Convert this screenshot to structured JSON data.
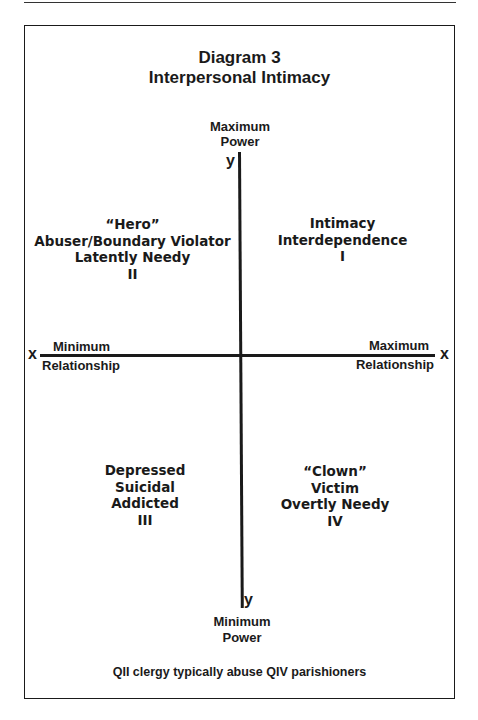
{
  "title": {
    "line1": "Diagram 3",
    "line2": "Interpersonal Intimacy"
  },
  "axes": {
    "y_top": {
      "letter": "y",
      "line1": "Maximum",
      "line2": "Power"
    },
    "y_bottom": {
      "letter": "y",
      "line1": "Minimum",
      "line2": "Power"
    },
    "x_left": {
      "letter": "x",
      "line1": "Minimum",
      "line2": "Relationship"
    },
    "x_right": {
      "letter": "x",
      "line1": "Maximum",
      "line2": "Relationship"
    }
  },
  "quadrants": {
    "q1": {
      "lines": [
        "Intimacy",
        "Interdependence",
        "I"
      ]
    },
    "q2": {
      "lines": [
        "“Hero”",
        "Abuser/Boundary Violator",
        "Latently Needy",
        "II"
      ]
    },
    "q3": {
      "lines": [
        "Depressed",
        "Suicidal",
        "Addicted",
        "III"
      ]
    },
    "q4": {
      "lines": [
        "“Clown”",
        "Victim",
        "Overtly Needy",
        "IV"
      ]
    }
  },
  "footer": "QII clergy typically abuse QIV parishioners",
  "colors": {
    "ink": "#1a1a1a",
    "background": "#ffffff"
  }
}
